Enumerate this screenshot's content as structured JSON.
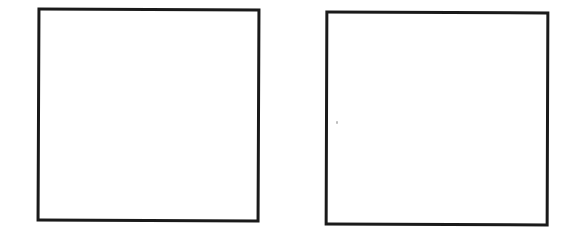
{
  "diagram": {
    "shapes": [
      {
        "id": "left-square",
        "type": "square",
        "fill": "#ffffff",
        "stroke": "#1a1a1a",
        "label": ""
      },
      {
        "id": "right-square",
        "type": "square",
        "fill": "#ffffff",
        "stroke": "#1a1a1a",
        "label": ""
      }
    ]
  }
}
